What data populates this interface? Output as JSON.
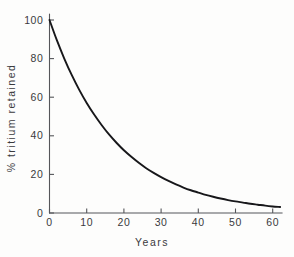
{
  "chart_data": {
    "type": "line",
    "title": "",
    "subtitle": "",
    "xlabel": "Years",
    "ylabel": "% tritium retained",
    "xlim": [
      0,
      62.5
    ],
    "ylim": [
      0,
      103
    ],
    "grid": false,
    "legend": "none",
    "xticks": [
      0,
      10,
      20,
      30,
      40,
      50,
      60
    ],
    "xticklabels": [
      "0",
      "10",
      "20",
      "30",
      "40",
      "50",
      "60"
    ],
    "yticks": [
      0,
      20,
      40,
      60,
      80,
      100
    ],
    "yticklabels": [
      "0",
      "20",
      "40",
      "60",
      "80",
      "100"
    ],
    "series": [
      {
        "name": "% tritium retained",
        "color": "#17171a",
        "x": [
          0,
          2,
          4,
          6,
          8,
          10,
          12,
          14,
          16,
          18,
          20,
          22,
          24,
          26,
          28,
          30,
          32,
          34,
          36,
          38,
          40,
          42,
          44,
          46,
          48,
          50,
          52,
          54,
          56,
          58,
          60,
          62
        ],
        "values": [
          100.0,
          89.4,
          79.9,
          71.4,
          63.8,
          57.0,
          51.0,
          45.6,
          40.7,
          36.4,
          32.5,
          29.1,
          26.0,
          23.2,
          20.8,
          18.6,
          16.6,
          14.8,
          13.2,
          11.8,
          10.6,
          9.4,
          8.4,
          7.5,
          6.7,
          6.0,
          5.4,
          4.8,
          4.3,
          3.8,
          3.4,
          3.1
        ]
      }
    ],
    "annotations": []
  },
  "axes": {
    "y_axis_label": "% tritium retained",
    "x_axis_label": "Years"
  }
}
